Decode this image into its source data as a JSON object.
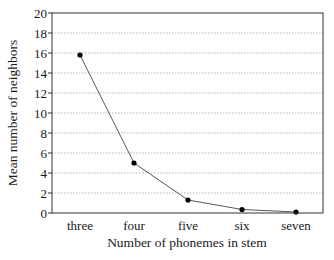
{
  "chart_data": {
    "type": "line",
    "title": "",
    "xlabel": "Number of phonemes in stem",
    "ylabel": "Mean number of neighbors",
    "categories": [
      "three",
      "four",
      "five",
      "six",
      "seven"
    ],
    "series": [
      {
        "name": "Mean number of neighbors",
        "values": [
          15.8,
          5.0,
          1.3,
          0.35,
          0.1
        ],
        "color": "#000000",
        "marker": "circle"
      }
    ],
    "ylim": [
      0,
      20
    ],
    "yticks": [
      0,
      2,
      4,
      6,
      8,
      10,
      12,
      14,
      16,
      18,
      20
    ],
    "grid": {
      "y": true,
      "x": false,
      "style": "dotted"
    },
    "legend": null
  },
  "colors": {
    "line": "#555555",
    "marker": "#000000",
    "frame": "#333333",
    "grid": "#b5b5b5"
  }
}
